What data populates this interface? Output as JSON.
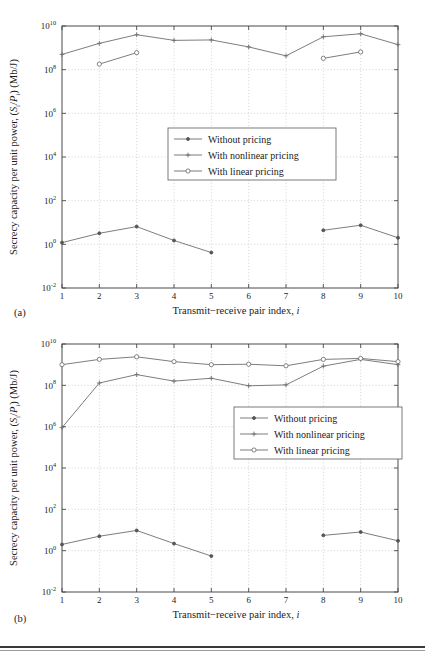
{
  "figure": {
    "panels": [
      {
        "tag": "(a)",
        "xlabel_main": "Transmit−receive pair index,",
        "xlabel_italic": "i",
        "ylabel": "Secrecy capacity per unit power, (Sᵢ/Pᵢ) (Mb/J)",
        "ylabel_parts": [
          "Secrecy capacity per unit power, (",
          "S",
          "/",
          "P",
          ") (Mb/J)"
        ],
        "legend": [
          {
            "label": "Without pricing",
            "marker": "dot"
          },
          {
            "label": "With nonlinear pricing",
            "marker": "plus"
          },
          {
            "label": "With linear pricing",
            "marker": "circle"
          }
        ]
      },
      {
        "tag": "(b)",
        "xlabel_main": "Transmit−receive pair index,",
        "xlabel_italic": "i",
        "ylabel": "Secrecy capacity per unit power, (Sᵢ/Pᵢ) (Mb/J)",
        "legend": [
          {
            "label": "Without pricing",
            "marker": "dot"
          },
          {
            "label": "With nonlinear pricing",
            "marker": "plus"
          },
          {
            "label": "With linear pricing",
            "marker": "circle"
          }
        ]
      }
    ]
  },
  "chart_data": [
    {
      "type": "line",
      "panel": "(a)",
      "title": "",
      "xlabel": "Transmit−receive pair index, i",
      "ylabel": "Secrecy capacity per unit power, (Si/Pi) (Mb/J)",
      "yscale": "log",
      "ylim": [
        0.01,
        10000000000
      ],
      "xlim": [
        1,
        10
      ],
      "xticks": [
        1,
        2,
        3,
        4,
        5,
        6,
        7,
        8,
        9,
        10
      ],
      "xticklabels": [
        "1",
        "2",
        "3",
        "4",
        "5",
        "6",
        "7",
        "8",
        "9",
        "10"
      ],
      "yticks": [
        0.01,
        1,
        100,
        10000,
        1000000,
        100000000,
        10000000000
      ],
      "yticklabels": [
        "10⁻²",
        "10⁰",
        "10²",
        "10⁴",
        "10⁶",
        "10⁸",
        "10¹⁰"
      ],
      "grid": true,
      "legend_position": "center",
      "series": [
        {
          "name": "Without pricing",
          "marker": "dot",
          "x": [
            1,
            2,
            3,
            4,
            5,
            8,
            9,
            10
          ],
          "values": [
            1.2,
            3.2,
            6.5,
            1.5,
            0.42,
            4.4,
            7.5,
            2.0
          ]
        },
        {
          "name": "With nonlinear pricing",
          "marker": "plus",
          "x": [
            1,
            2,
            3,
            4,
            5,
            6,
            7,
            8,
            9,
            10
          ],
          "values": [
            500000000,
            1600000000,
            4000000000,
            2200000000,
            2300000000,
            1100000000,
            430000000,
            3200000000,
            4400000000,
            1400000000
          ]
        },
        {
          "name": "With linear pricing",
          "marker": "circle",
          "x": [
            2,
            3,
            8,
            9
          ],
          "values": [
            180000000,
            600000000,
            330000000,
            650000000
          ]
        }
      ]
    },
    {
      "type": "line",
      "panel": "(b)",
      "title": "",
      "xlabel": "Transmit−receive pair index, i",
      "ylabel": "Secrecy capacity per unit power, (Si/Pi) (Mb/J)",
      "yscale": "log",
      "ylim": [
        0.01,
        10000000000
      ],
      "xlim": [
        1,
        10
      ],
      "xticks": [
        1,
        2,
        3,
        4,
        5,
        6,
        7,
        8,
        9,
        10
      ],
      "xticklabels": [
        "1",
        "2",
        "3",
        "4",
        "5",
        "6",
        "7",
        "8",
        "9",
        "10"
      ],
      "yticks": [
        0.01,
        1,
        100,
        10000,
        1000000,
        100000000,
        10000000000
      ],
      "yticklabels": [
        "10⁻²",
        "10⁰",
        "10²",
        "10⁴",
        "10⁶",
        "10⁸",
        "10¹⁰"
      ],
      "grid": true,
      "legend_position": "center-right",
      "series": [
        {
          "name": "Without pricing",
          "marker": "dot",
          "x": [
            1,
            2,
            3,
            4,
            5,
            8,
            9,
            10
          ],
          "values": [
            2.0,
            5.0,
            9.5,
            2.2,
            0.55,
            5.5,
            8.0,
            3.0
          ]
        },
        {
          "name": "With nonlinear pricing",
          "marker": "plus",
          "x": [
            1,
            2,
            3,
            4,
            5,
            6,
            7,
            8,
            9,
            10
          ],
          "values": [
            900000,
            130000000,
            330000000,
            160000000,
            220000000,
            95000000,
            105000000,
            850000000,
            1800000000,
            1000000000
          ]
        },
        {
          "name": "With linear pricing",
          "marker": "circle",
          "x": [
            1,
            2,
            3,
            4,
            5,
            6,
            7,
            8,
            9,
            10
          ],
          "values": [
            1000000000,
            1800000000,
            2400000000,
            1400000000,
            1000000000,
            1050000000,
            880000000,
            1800000000,
            2000000000,
            1400000000
          ]
        }
      ]
    }
  ]
}
